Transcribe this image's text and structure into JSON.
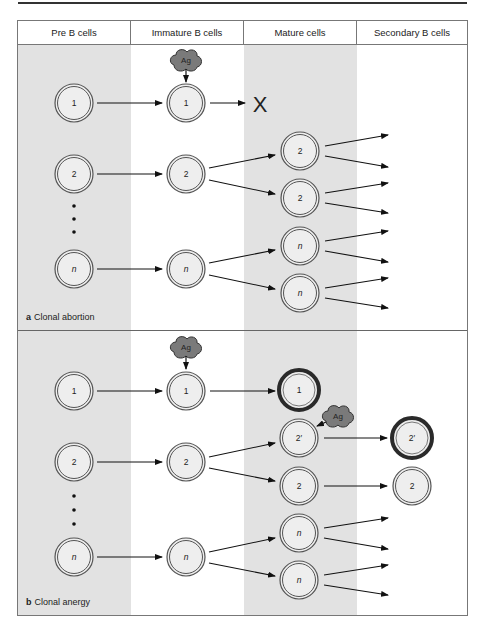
{
  "columns": [
    {
      "label": "Pre B cells"
    },
    {
      "label": "Immature B cells"
    },
    {
      "label": "Mature cells"
    },
    {
      "label": "Secondary B cells"
    }
  ],
  "panels": [
    {
      "letter": "a",
      "title": "Clonal abortion",
      "antigen_label": "Ag",
      "deleted_marker": "X",
      "cells": {
        "pre": [
          "1",
          "2",
          "n"
        ],
        "immature": [
          "1",
          "2",
          "n"
        ],
        "mature": [
          "2",
          "2",
          "n",
          "n"
        ]
      }
    },
    {
      "letter": "b",
      "title": "Clonal anergy",
      "antigen_label": "Ag",
      "antigen_label_2": "Ag",
      "cells": {
        "pre": [
          "1",
          "2",
          "n"
        ],
        "immature": [
          "1",
          "2",
          "n"
        ],
        "mature": [
          "1",
          "2′",
          "2",
          "n",
          "n"
        ],
        "secondary": [
          "2′",
          "2"
        ]
      }
    }
  ],
  "colors": {
    "gray_column": "#e2e2e2",
    "cell_fill": "#eeeeee",
    "cell_ring": "#555555",
    "anergic_ring": "#2a2a2a",
    "antigen_fill": "#7a7a7a"
  }
}
